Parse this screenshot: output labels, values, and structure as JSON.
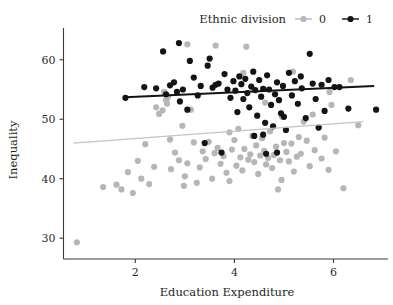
{
  "chart_data": {
    "type": "scatter",
    "title": "",
    "xlabel": "Education Expenditure",
    "ylabel": "Inequality",
    "xlim": [
      0.55,
      7.1
    ],
    "ylim": [
      26.5,
      64.5
    ],
    "xticks": [
      2,
      4,
      6
    ],
    "yticks": [
      30,
      40,
      50,
      60
    ],
    "grid": false,
    "legend": {
      "title": "Ethnic division",
      "position": "top-right",
      "entries": [
        {
          "label": "0",
          "color": "#b6b6b6"
        },
        {
          "label": "1",
          "color": "#141414"
        }
      ]
    },
    "series": [
      {
        "name": "0",
        "label": "0",
        "color": "#b6b6b6",
        "marker": "circle",
        "points": [
          [
            0.82,
            29.3
          ],
          [
            1.35,
            38.6
          ],
          [
            1.62,
            39.0
          ],
          [
            1.72,
            38.2
          ],
          [
            1.85,
            41.1
          ],
          [
            1.95,
            37.6
          ],
          [
            2.05,
            43.0
          ],
          [
            2.12,
            40.0
          ],
          [
            2.2,
            45.8
          ],
          [
            2.28,
            39.1
          ],
          [
            2.38,
            42.0
          ],
          [
            2.42,
            52.0
          ],
          [
            2.48,
            50.9
          ],
          [
            2.55,
            51.5
          ],
          [
            2.58,
            54.6
          ],
          [
            2.62,
            53.2
          ],
          [
            2.66,
            53.8
          ],
          [
            2.7,
            46.6
          ],
          [
            2.72,
            41.6
          ],
          [
            2.8,
            44.4
          ],
          [
            2.88,
            43.1
          ],
          [
            2.95,
            48.9
          ],
          [
            3.0,
            40.4
          ],
          [
            3.05,
            42.6
          ],
          [
            3.12,
            51.6
          ],
          [
            3.18,
            46.1
          ],
          [
            3.24,
            39.3
          ],
          [
            3.3,
            41.9
          ],
          [
            3.36,
            44.6
          ],
          [
            3.42,
            43.3
          ],
          [
            3.48,
            46.2
          ],
          [
            3.55,
            40.0
          ],
          [
            3.6,
            44.3
          ],
          [
            3.66,
            45.2
          ],
          [
            3.72,
            42.5
          ],
          [
            3.78,
            43.8
          ],
          [
            3.84,
            41.0
          ],
          [
            3.9,
            47.8
          ],
          [
            3.95,
            44.9
          ],
          [
            4.0,
            46.5
          ],
          [
            4.04,
            42.2
          ],
          [
            4.08,
            48.4
          ],
          [
            4.12,
            43.6
          ],
          [
            4.16,
            41.4
          ],
          [
            4.2,
            45.0
          ],
          [
            4.24,
            62.2
          ],
          [
            4.28,
            43.2
          ],
          [
            4.32,
            44.1
          ],
          [
            4.36,
            47.2
          ],
          [
            4.4,
            42.8
          ],
          [
            4.44,
            45.6
          ],
          [
            4.48,
            40.8
          ],
          [
            4.52,
            43.9
          ],
          [
            4.56,
            46.8
          ],
          [
            4.6,
            44.7
          ],
          [
            4.64,
            42.4
          ],
          [
            4.68,
            43.5
          ],
          [
            4.72,
            48.0
          ],
          [
            4.76,
            41.8
          ],
          [
            4.8,
            44.0
          ],
          [
            4.84,
            45.4
          ],
          [
            4.88,
            38.2
          ],
          [
            4.92,
            43.1
          ],
          [
            4.96,
            50.4
          ],
          [
            5.0,
            46.0
          ],
          [
            5.05,
            44.5
          ],
          [
            5.1,
            42.9
          ],
          [
            5.15,
            45.9
          ],
          [
            5.2,
            41.2
          ],
          [
            5.26,
            43.7
          ],
          [
            5.3,
            47.0
          ],
          [
            5.34,
            44.2
          ],
          [
            5.4,
            49.6
          ],
          [
            5.46,
            46.4
          ],
          [
            5.52,
            42.1
          ],
          [
            5.58,
            50.8
          ],
          [
            5.62,
            44.8
          ],
          [
            5.7,
            48.6
          ],
          [
            5.76,
            43.4
          ],
          [
            5.82,
            46.9
          ],
          [
            5.9,
            41.5
          ],
          [
            5.96,
            52.4
          ],
          [
            6.05,
            44.6
          ],
          [
            6.2,
            38.4
          ],
          [
            6.35,
            56.6
          ],
          [
            6.5,
            49.0
          ],
          [
            3.05,
            62.6
          ],
          [
            3.62,
            62.4
          ],
          [
            4.18,
            57.8
          ],
          [
            5.18,
            58.0
          ],
          [
            5.92,
            54.6
          ],
          [
            2.64,
            52.6
          ],
          [
            4.62,
            52.8
          ],
          [
            4.95,
            39.8
          ],
          [
            3.9,
            39.6
          ],
          [
            2.98,
            38.8
          ]
        ]
      },
      {
        "name": "1",
        "label": "1",
        "color": "#141414",
        "marker": "circle",
        "points": [
          [
            1.8,
            53.6
          ],
          [
            2.18,
            55.4
          ],
          [
            2.42,
            55.2
          ],
          [
            2.56,
            61.4
          ],
          [
            2.62,
            54.2
          ],
          [
            2.7,
            55.7
          ],
          [
            2.78,
            56.2
          ],
          [
            2.84,
            54.6
          ],
          [
            2.9,
            53.0
          ],
          [
            2.96,
            55.0
          ],
          [
            3.05,
            51.6
          ],
          [
            3.1,
            59.8
          ],
          [
            3.18,
            57.0
          ],
          [
            3.26,
            54.0
          ],
          [
            3.32,
            55.6
          ],
          [
            3.4,
            46.0
          ],
          [
            3.46,
            59.0
          ],
          [
            3.56,
            55.3
          ],
          [
            3.62,
            55.8
          ],
          [
            3.68,
            56.0
          ],
          [
            3.74,
            44.4
          ],
          [
            3.8,
            57.6
          ],
          [
            3.86,
            55.0
          ],
          [
            3.92,
            53.6
          ],
          [
            3.98,
            56.4
          ],
          [
            4.02,
            54.8
          ],
          [
            4.06,
            51.2
          ],
          [
            4.1,
            57.2
          ],
          [
            4.14,
            55.9
          ],
          [
            4.18,
            53.4
          ],
          [
            4.22,
            56.8
          ],
          [
            4.26,
            54.4
          ],
          [
            4.3,
            52.0
          ],
          [
            4.34,
            55.5
          ],
          [
            4.38,
            58.0
          ],
          [
            4.42,
            54.9
          ],
          [
            4.46,
            50.6
          ],
          [
            4.5,
            56.6
          ],
          [
            4.54,
            53.8
          ],
          [
            4.58,
            55.1
          ],
          [
            4.62,
            49.4
          ],
          [
            4.66,
            57.4
          ],
          [
            4.7,
            55.0
          ],
          [
            4.74,
            52.4
          ],
          [
            4.78,
            48.8
          ],
          [
            4.82,
            54.2
          ],
          [
            4.86,
            56.2
          ],
          [
            4.9,
            53.2
          ],
          [
            4.94,
            51.0
          ],
          [
            4.98,
            55.6
          ],
          [
            5.04,
            48.2
          ],
          [
            5.1,
            57.8
          ],
          [
            5.16,
            54.0
          ],
          [
            5.22,
            56.4
          ],
          [
            5.28,
            52.6
          ],
          [
            5.36,
            55.2
          ],
          [
            5.44,
            50.2
          ],
          [
            5.52,
            61.0
          ],
          [
            5.58,
            56.0
          ],
          [
            5.64,
            53.4
          ],
          [
            5.7,
            48.6
          ],
          [
            5.76,
            55.8
          ],
          [
            5.82,
            51.4
          ],
          [
            5.9,
            56.6
          ],
          [
            6.02,
            55.4
          ],
          [
            6.12,
            55.4
          ],
          [
            6.3,
            51.8
          ],
          [
            6.86,
            51.6
          ],
          [
            4.86,
            44.4
          ],
          [
            4.58,
            47.4
          ],
          [
            4.4,
            47.2
          ],
          [
            5.0,
            50.4
          ],
          [
            4.64,
            44.2
          ],
          [
            3.5,
            60.2
          ],
          [
            2.88,
            62.8
          ],
          [
            5.34,
            57.2
          ]
        ]
      }
    ],
    "fit_lines": [
      {
        "series": "0",
        "color": "#c4c4c4",
        "x0": 0.75,
        "y0": 46.0,
        "x1": 6.6,
        "y1": 49.6
      },
      {
        "series": "1",
        "color": "#141414",
        "x0": 1.8,
        "y0": 53.7,
        "x1": 6.82,
        "y1": 55.6
      }
    ]
  }
}
